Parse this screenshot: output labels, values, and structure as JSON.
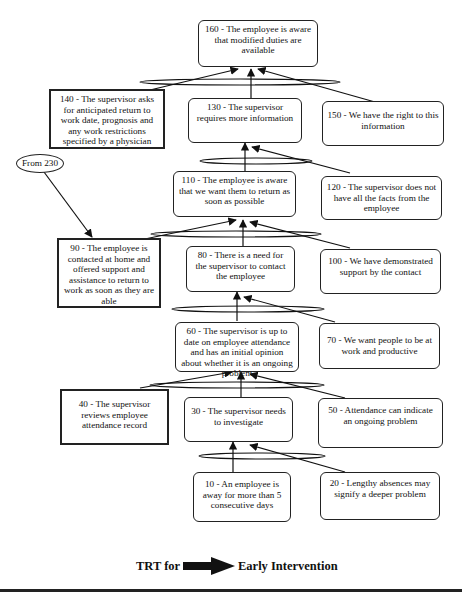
{
  "diagram": {
    "title_left": "TRT for",
    "title_right": "Early Intervention",
    "nodes": {
      "n160": "160 - The employee is aware that modified duties are available",
      "n140": "140 - The supervisor asks for anticipated return to work date, prognosis and any work restrictions specified by a physician",
      "n130": "130 - The supervisor requires more information",
      "n150": "150 - We have the right to this information",
      "n110": "110 - The employee is aware that we want them to return as soon as possible",
      "n120": "120 - The supervisor does not have all the facts from the employee",
      "n90": "90 - The employee is contacted at home and offered support and assistance to return to work as soon as they are able",
      "n80": "80 - There is a need for the supervisor to contact the employee",
      "n100": "100 - We have demonstrated support by the contact",
      "n60": "60 - The supervisor is up to date on employee attendance and has an initial opinion about whether it is an ongoing problem",
      "n70": "70 - We want people to be at work and productive",
      "n40": "40 - The supervisor reviews employee attendance record",
      "n30": "30 - The supervisor needs to investigate",
      "n50": "50 - Attendance can indicate an ongoing problem",
      "n10": "10 - An employee is away for more than 5 consecutive days",
      "n20": "20 - Lengthy absences may signify a deeper problem"
    },
    "connector": "From 230",
    "edges": [
      {
        "from": [
          "10",
          "20"
        ],
        "to": "30"
      },
      {
        "from": [
          "40",
          "30",
          "50"
        ],
        "to": "60"
      },
      {
        "from": [
          "60",
          "70"
        ],
        "to": "80"
      },
      {
        "from": [
          "90",
          "80",
          "100"
        ],
        "to": "110"
      },
      {
        "from": [
          "110",
          "120"
        ],
        "to": "130"
      },
      {
        "from": [
          "140",
          "130",
          "150"
        ],
        "to": "160"
      },
      {
        "from": [
          "From 230"
        ],
        "to": "90"
      }
    ]
  }
}
